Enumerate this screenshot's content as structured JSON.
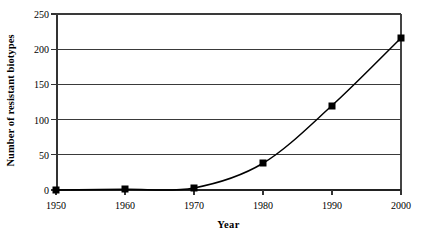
{
  "chart_data": {
    "type": "line",
    "title": "",
    "xlabel": "Year",
    "ylabel": "Number of resistant biotypes",
    "x": [
      1950,
      1960,
      1970,
      1980,
      1990,
      2000
    ],
    "values": [
      0,
      1,
      3,
      38,
      120,
      216
    ],
    "series": [
      {
        "name": "Number of resistant biotypes",
        "values": [
          0,
          1,
          3,
          38,
          120,
          216
        ]
      }
    ],
    "xlim": [
      1950,
      2000
    ],
    "ylim": [
      0,
      250
    ],
    "x_tick_labels": [
      "1950",
      "1960",
      "1970",
      "1980",
      "1990",
      "2000"
    ],
    "y_tick_labels": [
      "0",
      "50",
      "100",
      "150",
      "200",
      "250"
    ],
    "y_ticks": [
      0,
      50,
      100,
      150,
      200,
      250
    ],
    "grid": true,
    "grid_axis": "y",
    "legend": false,
    "legend_position": "none",
    "marker": "square",
    "marker_color": "#000000",
    "line_color": "#000000",
    "background_color": "#ffffff",
    "gridline_color": "#3a3a3a"
  }
}
